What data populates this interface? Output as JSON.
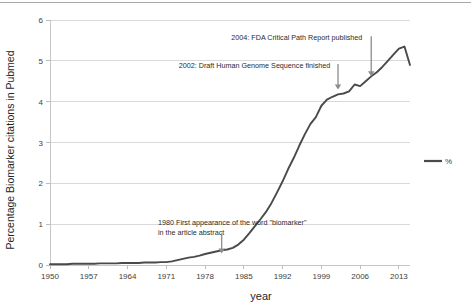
{
  "chart_data": {
    "type": "line",
    "title": "",
    "xlabel": "year",
    "ylabel": "Percentage Biomarker citations in Pubmed",
    "xlim": [
      1950,
      2015
    ],
    "ylim": [
      0,
      6
    ],
    "xticks": [
      1950,
      1957,
      1964,
      1971,
      1978,
      1985,
      1992,
      1999,
      2006,
      2013
    ],
    "yticks": [
      0,
      1,
      2,
      3,
      4,
      5,
      6
    ],
    "grid": true,
    "legend_position": "right",
    "series": [
      {
        "name": "%",
        "color": "#4a4a4a",
        "x": [
          1950,
          1951,
          1952,
          1953,
          1954,
          1955,
          1956,
          1957,
          1958,
          1959,
          1960,
          1961,
          1962,
          1963,
          1964,
          1965,
          1966,
          1967,
          1968,
          1969,
          1970,
          1971,
          1972,
          1973,
          1974,
          1975,
          1976,
          1977,
          1978,
          1979,
          1980,
          1981,
          1982,
          1983,
          1984,
          1985,
          1986,
          1987,
          1988,
          1989,
          1990,
          1991,
          1992,
          1993,
          1994,
          1995,
          1996,
          1997,
          1998,
          1999,
          2000,
          2001,
          2002,
          2003,
          2004,
          2005,
          2006,
          2007,
          2008,
          2009,
          2010,
          2011,
          2012,
          2013,
          2014,
          2015
        ],
        "y": [
          0.02,
          0.02,
          0.02,
          0.02,
          0.03,
          0.03,
          0.03,
          0.03,
          0.03,
          0.04,
          0.04,
          0.04,
          0.04,
          0.05,
          0.05,
          0.05,
          0.05,
          0.06,
          0.06,
          0.06,
          0.07,
          0.07,
          0.09,
          0.12,
          0.15,
          0.18,
          0.2,
          0.23,
          0.27,
          0.3,
          0.33,
          0.36,
          0.38,
          0.42,
          0.5,
          0.62,
          0.78,
          0.95,
          1.12,
          1.3,
          1.52,
          1.78,
          2.05,
          2.35,
          2.62,
          2.92,
          3.2,
          3.45,
          3.62,
          3.9,
          4.05,
          4.12,
          4.18,
          4.2,
          4.25,
          4.42,
          4.38,
          4.5,
          4.62,
          4.72,
          4.85,
          5.0,
          5.15,
          5.3,
          5.35,
          4.9
        ]
      }
    ],
    "annotations": [
      {
        "id": "annotation-1980",
        "lines": [
          "1980 First appearance of the word \"biomarker\"",
          "in the article abstract"
        ],
        "label_x": 1969.5,
        "label_y": 0.98,
        "align": "start",
        "arrow_x": 1981,
        "arrow_y_top": 0.78,
        "arrow_y_bottom": 0.28
      },
      {
        "id": "annotation-2002",
        "lines": [
          "2002: Draft Human Genome Sequence finished"
        ],
        "label_x": 2000.6,
        "label_y": 4.82,
        "align": "end",
        "arrow_x": 2002,
        "arrow_y_top": 4.92,
        "arrow_y_bottom": 4.3
      },
      {
        "id": "annotation-2004",
        "lines": [
          "2004: FDA Critical Path Report published"
        ],
        "label_x": 2006.4,
        "label_y": 5.5,
        "align": "end",
        "arrow_x": 2008,
        "arrow_y_top": 5.6,
        "arrow_y_bottom": 4.62
      }
    ]
  }
}
